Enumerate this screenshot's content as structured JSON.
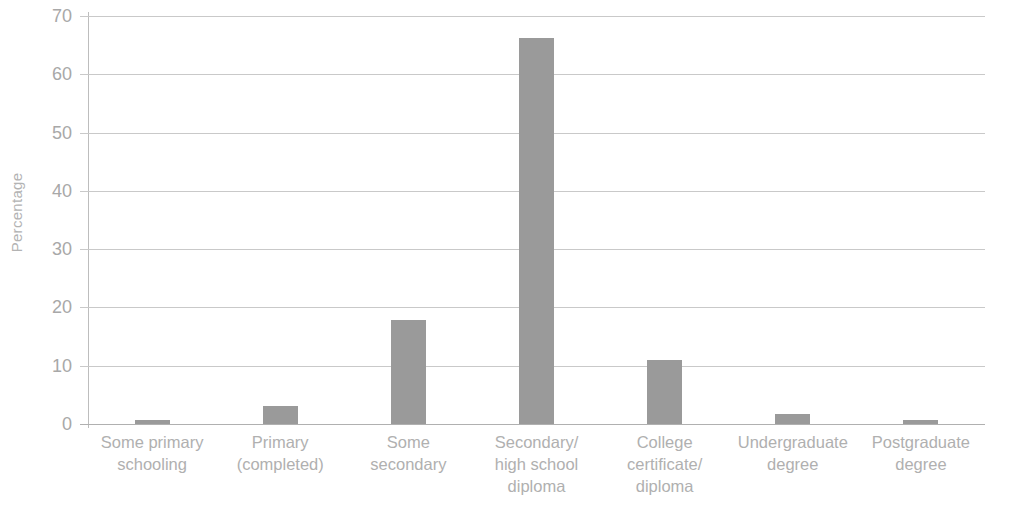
{
  "chart_data": {
    "type": "bar",
    "title": "",
    "subtitle": "",
    "xlabel": "",
    "ylabel": "Percentage",
    "categories": [
      "Some primary\nschooling",
      "Primary\n(completed)",
      "Some\nsecondary",
      "Secondary/\nhigh school\ndiploma",
      "College\ncertificate/\ndiploma",
      "Undergraduate\ndegree",
      "Postgraduate\ndegree"
    ],
    "values": [
      0.7,
      3.1,
      17.8,
      66.2,
      11.0,
      1.7,
      0.7
    ],
    "ylim": [
      0,
      70
    ],
    "yticks": [
      0,
      10,
      20,
      30,
      40,
      50,
      60,
      70
    ],
    "ytick_labels": [
      "0",
      "10",
      "20",
      "30",
      "40",
      "50",
      "60",
      "70"
    ],
    "grid": true,
    "legend": false,
    "legend_position": "none",
    "bar_color": "#9a9a9a",
    "gridline_color": "#c9c9c9",
    "axis_color": "#bdbdbd",
    "text_color": "#b0b0b0",
    "background_color": "#ffffff"
  }
}
